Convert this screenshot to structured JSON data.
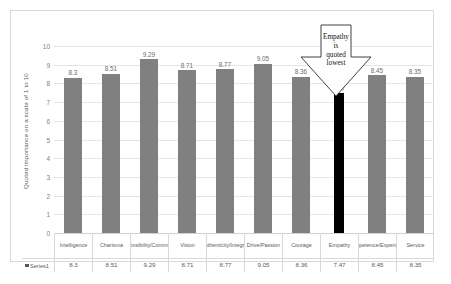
{
  "chart_data": {
    "type": "bar",
    "title": "",
    "xlabel": "",
    "ylabel": "Quoted importance on a scale of 1 to 10",
    "ylim": [
      0,
      10
    ],
    "ytick_labels": [
      "10",
      "9",
      "8",
      "7",
      "6",
      "5",
      "4",
      "3",
      "2",
      "1",
      "0"
    ],
    "grid": true,
    "legend_position": "table-row",
    "series_name": "Series1",
    "categories": [
      "Intelligence",
      "Charisma",
      "Responsibility/Commitment",
      "Vision",
      "Authenticity/Integrity",
      "Drive/Passion",
      "Courage",
      "Empathy",
      "Competence/Experience",
      "Service"
    ],
    "values": [
      8.3,
      8.51,
      9.29,
      8.71,
      8.77,
      9.05,
      8.36,
      7.47,
      8.45,
      8.35
    ],
    "value_labels": [
      "8.3",
      "8.51",
      "9.29",
      "8.71",
      "8.77",
      "9.05",
      "8.36",
      "7.47",
      "8.45",
      "8.35"
    ],
    "highlight_index": 7,
    "bar_color": "#808080",
    "highlight_color": "#000000",
    "annotation": {
      "line1": "Empathy",
      "line2": "is",
      "line3": "quoted",
      "line4": "lowest"
    }
  }
}
